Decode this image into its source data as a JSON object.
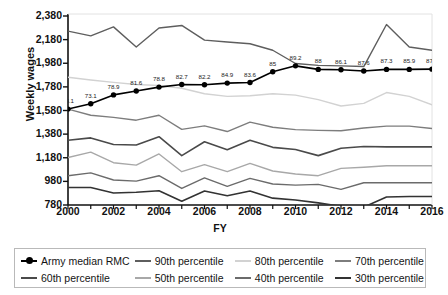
{
  "chart_data": {
    "type": "line",
    "title": "",
    "xlabel": "FY",
    "ylabel": "Weekly wages",
    "xlim": [
      2000,
      2016
    ],
    "ylim": [
      780,
      2380
    ],
    "ytick_values": [
      780,
      980,
      1180,
      1380,
      1580,
      1780,
      1980,
      2180,
      2380
    ],
    "ytick_labels": [
      "780",
      "980",
      "1,180",
      "1,380",
      "1,580",
      "1,780",
      "1,980",
      "2,180",
      "2,380"
    ],
    "xtick_values": [
      2000,
      2002,
      2004,
      2006,
      2008,
      2010,
      2012,
      2014,
      2016
    ],
    "xtick_labels": [
      "2000",
      "2002",
      "2004",
      "2006",
      "2008",
      "2010",
      "2012",
      "2014",
      "2016"
    ],
    "x": [
      2000,
      2001,
      2002,
      2003,
      2004,
      2005,
      2006,
      2007,
      2008,
      2009,
      2010,
      2011,
      2012,
      2013,
      2014,
      2015,
      2016
    ],
    "grid": false,
    "legend_position": "bottom",
    "series": [
      {
        "name": "Army median RMC",
        "color": "#000000",
        "width": 1.6,
        "markers": true,
        "values": [
          1592,
          1637,
          1712,
          1745,
          1778,
          1800,
          1798,
          1812,
          1817,
          1908,
          1958,
          1928,
          1925,
          1915,
          1928,
          1928,
          1930
        ],
        "point_labels": [
          "73.1",
          "73.1",
          "78.9",
          "81.6",
          "78.8",
          "82.7",
          "82.2",
          "84.9",
          "83.6",
          "85",
          "89.2",
          "88",
          "86.1",
          "87.6",
          "87.3",
          "85.9",
          "87.3"
        ]
      },
      {
        "name": "90th percentile",
        "color": "#5e5e5e",
        "width": 1.4,
        "markers": false,
        "values": [
          2252,
          2212,
          2288,
          2118,
          2278,
          2300,
          2176,
          2160,
          2145,
          2090,
          1978,
          1962,
          1958,
          1952,
          2308,
          2118,
          2090
        ]
      },
      {
        "name": "80th percentile",
        "color": "#d2d2d2",
        "width": 1.4,
        "markers": false,
        "values": [
          1862,
          1838,
          1818,
          1800,
          1792,
          1768,
          1722,
          1700,
          1705,
          1722,
          1710,
          1672,
          1618,
          1640,
          1732,
          1700,
          1628
        ]
      },
      {
        "name": "70th percentile",
        "color": "#7d7d7d",
        "width": 1.4,
        "markers": false,
        "values": [
          1592,
          1540,
          1522,
          1498,
          1540,
          1420,
          1450,
          1402,
          1482,
          1438,
          1418,
          1412,
          1408,
          1432,
          1448,
          1448,
          1428
        ]
      },
      {
        "name": "60th percentile",
        "color": "#4a4a4a",
        "width": 1.6,
        "markers": false,
        "values": [
          1328,
          1348,
          1292,
          1288,
          1358,
          1198,
          1315,
          1248,
          1328,
          1268,
          1250,
          1198,
          1260,
          1275,
          1272,
          1272,
          1272
        ]
      },
      {
        "name": "50th percentile",
        "color": "#a8a8a8",
        "width": 1.4,
        "markers": false,
        "values": [
          1182,
          1228,
          1138,
          1118,
          1212,
          1062,
          1122,
          1062,
          1132,
          1068,
          1042,
          1028,
          1090,
          1100,
          1112,
          1112,
          1112
        ]
      },
      {
        "name": "40th percentile",
        "color": "#6b6b6b",
        "width": 1.4,
        "markers": false,
        "values": [
          1028,
          1052,
          992,
          982,
          1028,
          920,
          1010,
          938,
          1005,
          958,
          948,
          955,
          912,
          968,
          968,
          968,
          968
        ]
      },
      {
        "name": "30th percentile",
        "color": "#333333",
        "width": 1.6,
        "markers": false,
        "values": [
          928,
          928,
          882,
          888,
          900,
          812,
          898,
          858,
          898,
          838,
          822,
          798,
          768,
          762,
          848,
          852,
          852
        ]
      }
    ]
  },
  "legend": {
    "items": [
      {
        "label": "Army median RMC",
        "color": "#000000",
        "marker": true
      },
      {
        "label": "90th percentile",
        "color": "#5e5e5e",
        "marker": false
      },
      {
        "label": "80th percentile",
        "color": "#d2d2d2",
        "marker": false
      },
      {
        "label": "70th percentile",
        "color": "#7d7d7d",
        "marker": false
      },
      {
        "label": "60th percentile",
        "color": "#4a4a4a",
        "marker": false
      },
      {
        "label": "50th percentile",
        "color": "#a8a8a8",
        "marker": false
      },
      {
        "label": "40th percentile",
        "color": "#6b6b6b",
        "marker": false
      },
      {
        "label": "30th percentile",
        "color": "#333333",
        "marker": false
      }
    ]
  }
}
